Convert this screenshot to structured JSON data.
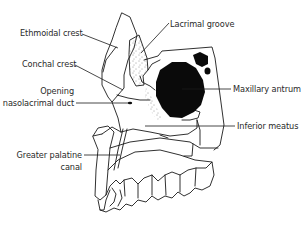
{
  "diagram": {
    "colors": {
      "line": "#1a1a1a",
      "fill_dark": "#0a0a0a",
      "background": "#ffffff"
    },
    "labels": [
      {
        "id": "ethmoidal-crest",
        "text": "Ethmoidal crest"
      },
      {
        "id": "lacrimal-groove",
        "text": "Lacrimal groove"
      },
      {
        "id": "conchal-crest",
        "text": "Conchal crest"
      },
      {
        "id": "opening-nasolacrimal-duct-line1",
        "text": "Opening"
      },
      {
        "id": "opening-nasolacrimal-duct-line2",
        "text": "nasolacrimal duct"
      },
      {
        "id": "maxillary-antrum",
        "text": "Maxillary antrum"
      },
      {
        "id": "inferior-meatus",
        "text": "Inferior meatus"
      },
      {
        "id": "greater-palatine-canal-line1",
        "text": "Greater palatine"
      },
      {
        "id": "greater-palatine-canal-line2",
        "text": "canal"
      }
    ]
  }
}
